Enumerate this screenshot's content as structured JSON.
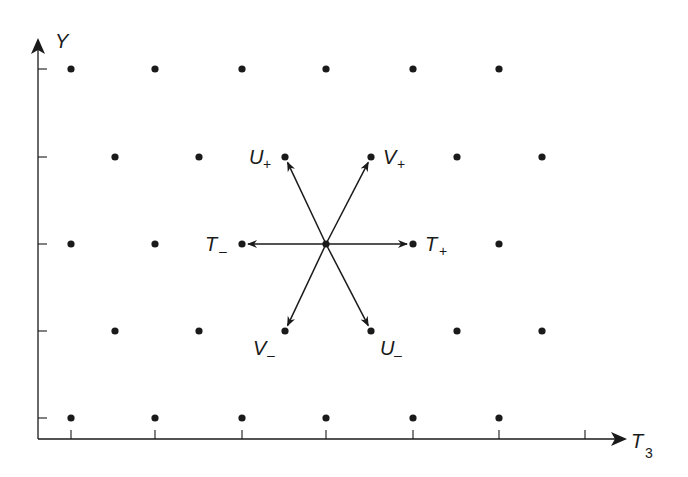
{
  "diagram": {
    "type": "weight-lattice",
    "colors": {
      "ink": "#1a1a1a",
      "background": "#ffffff"
    },
    "axes": {
      "x": {
        "label_main": "T",
        "label_sub": "3",
        "origin_x": 38,
        "baseline_y": 439,
        "end_x": 625,
        "ticks_x": [
          71,
          155,
          242,
          326,
          413,
          499,
          585
        ]
      },
      "y": {
        "label_main": "Y",
        "axis_x": 38,
        "top_y": 40,
        "bottom_y": 439,
        "ticks_y": [
          69,
          157,
          244,
          331,
          418
        ]
      }
    },
    "lattice_rows": [
      {
        "y": 69,
        "xs": [
          71,
          155,
          242,
          326,
          413,
          499
        ]
      },
      {
        "y": 157,
        "xs": [
          115,
          199,
          285,
          371,
          457,
          542
        ]
      },
      {
        "y": 244,
        "xs": [
          71,
          155,
          242,
          326,
          413,
          499
        ]
      },
      {
        "y": 331,
        "xs": [
          115,
          199,
          285,
          371,
          457,
          542
        ]
      },
      {
        "y": 418,
        "xs": [
          71,
          155,
          242,
          326,
          413,
          499
        ]
      }
    ],
    "center": {
      "x": 326,
      "y": 244
    },
    "operators": [
      {
        "name": "U+",
        "main": "U",
        "sub": "+",
        "to_x": 285,
        "to_y": 157,
        "label_x": 249,
        "label_y": 164
      },
      {
        "name": "V+",
        "main": "V",
        "sub": "+",
        "to_x": 371,
        "to_y": 157,
        "label_x": 383,
        "label_y": 164
      },
      {
        "name": "T-",
        "main": "T",
        "sub": "–",
        "to_x": 242,
        "to_y": 244,
        "label_x": 205,
        "label_y": 251
      },
      {
        "name": "T+",
        "main": "T",
        "sub": "+",
        "to_x": 413,
        "to_y": 244,
        "label_x": 425,
        "label_y": 251
      },
      {
        "name": "V-",
        "main": "V",
        "sub": "–",
        "to_x": 285,
        "to_y": 331,
        "label_x": 253,
        "label_y": 355
      },
      {
        "name": "U-",
        "main": "U",
        "sub": "–",
        "to_x": 371,
        "to_y": 331,
        "label_x": 380,
        "label_y": 355
      }
    ]
  }
}
